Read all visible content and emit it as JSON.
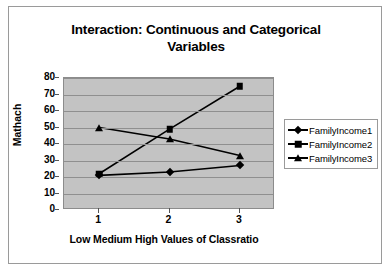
{
  "chart_data": {
    "type": "line",
    "title": "Interaction: Continuous and Categorical Variables",
    "title_line1": "Interaction: Continuous and Categorical",
    "title_line2": "Variables",
    "xlabel": "Low Medium High Values of Classratio",
    "ylabel": "Mathach",
    "categories": [
      "1",
      "2",
      "3"
    ],
    "x": [
      1,
      2,
      3
    ],
    "ylim": [
      0,
      80
    ],
    "ytick_values": [
      0,
      10,
      20,
      30,
      40,
      50,
      60,
      70,
      80
    ],
    "ytick_labels": [
      "0",
      "10",
      "20",
      "30",
      "40",
      "50",
      "60",
      "70",
      "80"
    ],
    "grid": "horizontal",
    "legend_position": "right",
    "plot_bgcolor": "#c3c3c3",
    "gridline_color": "#8f8f8f",
    "line_color": "#000000",
    "series": [
      {
        "name": "FamilyIncome1",
        "marker": "diamond",
        "values": [
          21,
          23,
          27
        ]
      },
      {
        "name": "FamilyIncome2",
        "marker": "square",
        "values": [
          22,
          49,
          75
        ]
      },
      {
        "name": "FamilyIncome3",
        "marker": "triangle",
        "values": [
          50,
          43,
          33
        ]
      }
    ]
  },
  "legend": {
    "items": [
      {
        "label": "FamilyIncome1",
        "marker": "diamond"
      },
      {
        "label": "FamilyIncome2",
        "marker": "square"
      },
      {
        "label": "FamilyIncome3",
        "marker": "triangle"
      }
    ]
  }
}
